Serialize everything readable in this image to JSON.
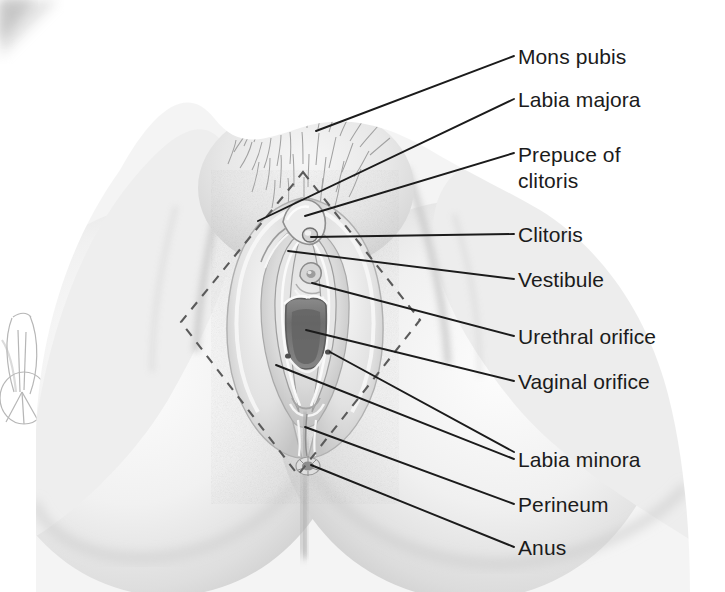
{
  "figure": {
    "type": "anatomical-illustration",
    "medium": "grayscale halftone drawing",
    "canvas": {
      "width": 725,
      "height": 592
    },
    "background_color": "#ffffff",
    "ink_color": "#1b1b1b",
    "skin_tone_light": "#f2f2f2",
    "skin_tone_mid": "#d9d9d9",
    "skin_tone_dark": "#a8a8a8",
    "aperture_color": "#6f6f6f"
  },
  "labels": [
    {
      "id": "mons-pubis",
      "text": "Mons pubis",
      "line2": "",
      "x": 518,
      "y": 44,
      "leader_to_x": 316,
      "leader_to_y": 131
    },
    {
      "id": "labia-majora",
      "text": "Labia majora",
      "line2": "",
      "x": 518,
      "y": 87,
      "leader_to_x": 258,
      "leader_to_y": 221
    },
    {
      "id": "prepuce-of-clitoris",
      "text": "Prepuce of",
      "line2": "clitoris",
      "x": 518,
      "y": 142,
      "leader_to_x": 305,
      "leader_to_y": 216
    },
    {
      "id": "clitoris",
      "text": "Clitoris",
      "line2": "",
      "x": 518,
      "y": 222,
      "leader_to_x": 311,
      "leader_to_y": 237
    },
    {
      "id": "vestibule",
      "text": "Vestibule",
      "line2": "",
      "x": 518,
      "y": 267,
      "leader_to_x": 288,
      "leader_to_y": 251
    },
    {
      "id": "urethral-orifice",
      "text": "Urethral orifice",
      "line2": "",
      "x": 518,
      "y": 324,
      "leader_to_x": 312,
      "leader_to_y": 283
    },
    {
      "id": "vaginal-orifice",
      "text": "Vaginal orifice",
      "line2": "",
      "x": 518,
      "y": 369,
      "leader_to_x": 306,
      "leader_to_y": 330
    },
    {
      "id": "labia-minora",
      "text": "Labia minora",
      "line2": "",
      "x": 518,
      "y": 447,
      "leader_to_x": 276,
      "leader_to_y": 365
    },
    {
      "id": "perineum",
      "text": "Perineum",
      "line2": "",
      "x": 518,
      "y": 492,
      "leader_to_x": 305,
      "leader_to_y": 427
    },
    {
      "id": "anus",
      "text": "Anus",
      "line2": "",
      "x": 518,
      "y": 535,
      "leader_to_x": 311,
      "leader_to_y": 465
    }
  ],
  "leader_lines": [
    {
      "id": "leader-mons-pubis",
      "x1": 316,
      "y1": 131,
      "x2": 514,
      "y2": 56
    },
    {
      "id": "leader-labia-majora",
      "x1": 258,
      "y1": 221,
      "x2": 514,
      "y2": 99
    },
    {
      "id": "leader-prepuce",
      "x1": 305,
      "y1": 216,
      "x2": 514,
      "y2": 153
    },
    {
      "id": "leader-clitoris",
      "x1": 311,
      "y1": 237,
      "x2": 514,
      "y2": 234
    },
    {
      "id": "leader-vestibule",
      "x1": 288,
      "y1": 251,
      "x2": 514,
      "y2": 279
    },
    {
      "id": "leader-urethral-orifice",
      "x1": 312,
      "y1": 283,
      "x2": 514,
      "y2": 336
    },
    {
      "id": "leader-vaginal-orifice",
      "x1": 306,
      "y1": 330,
      "x2": 514,
      "y2": 381
    },
    {
      "id": "leader-labia-minora-left",
      "x1": 276,
      "y1": 365,
      "x2": 514,
      "y2": 459
    },
    {
      "id": "leader-labia-minora-right",
      "x1": 330,
      "y1": 352,
      "x2": 514,
      "y2": 452
    },
    {
      "id": "leader-perineum",
      "x1": 305,
      "y1": 427,
      "x2": 514,
      "y2": 504
    },
    {
      "id": "leader-anus",
      "x1": 311,
      "y1": 465,
      "x2": 514,
      "y2": 547
    }
  ],
  "annotations": {
    "dashed_outline": {
      "id": "perineal-diamond",
      "description": "dashed diamond outlining the perineal region",
      "points": "303,172 420,320 298,475 181,322",
      "dash": "9 8",
      "color": "#5a5a5a"
    },
    "margin_sketch": {
      "id": "margin-sketch-artifact",
      "description": "faint pencil sketch showing through from adjacent page, left margin"
    },
    "corner_artifact": {
      "id": "page-corner-shadow",
      "description": "dark diagonal page-edge shadow, top-left corner"
    }
  }
}
